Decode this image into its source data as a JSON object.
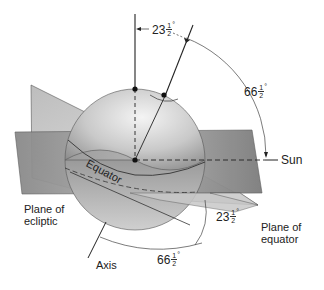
{
  "diagram": {
    "labels": {
      "equator": "Equator",
      "sun": "Sun",
      "plane_of_ecliptic_line1": "Plane of",
      "plane_of_ecliptic_line2": "ecliptic",
      "plane_of_equator_line1": "Plane of",
      "plane_of_equator_line2": "equator",
      "axis": "Axis"
    },
    "angles": [
      {
        "id": "top",
        "whole": "23",
        "num": "1",
        "den": "2",
        "deg": "°"
      },
      {
        "id": "right",
        "whole": "66",
        "num": "1",
        "den": "2",
        "deg": "°"
      },
      {
        "id": "lower-right",
        "whole": "23",
        "num": "1",
        "den": "2",
        "deg": "°"
      },
      {
        "id": "bottom",
        "whole": "66",
        "num": "1",
        "den": "2",
        "deg": "°"
      }
    ],
    "colors": {
      "line": "#222222",
      "plane_dark": "#7a7a7a",
      "plane_light": "#d4d4d4",
      "globe_light": "#eeeeee",
      "globe_dark": "#8a8a8a"
    }
  }
}
